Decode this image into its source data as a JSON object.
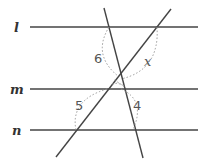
{
  "diagram": {
    "parallel_lines": [
      {
        "name": "l",
        "label": "l",
        "y": 27,
        "x1": 30,
        "x2": 198
      },
      {
        "name": "m",
        "label": "m",
        "y": 89,
        "x1": 30,
        "x2": 198
      },
      {
        "name": "n",
        "label": "n",
        "y": 130,
        "x1": 30,
        "x2": 198
      }
    ],
    "transversals": [
      {
        "name": "steep",
        "x1": 104,
        "y1": 8,
        "x2": 143,
        "y2": 158
      },
      {
        "name": "diagonal",
        "x1": 171,
        "y1": 9,
        "x2": 56,
        "y2": 157
      }
    ],
    "angle_labels": [
      {
        "id": "angle-6",
        "text": "6",
        "x": 94,
        "y": 63
      },
      {
        "id": "angle-x",
        "text": "x",
        "x": 144,
        "y": 63
      },
      {
        "id": "angle-5",
        "text": "5",
        "x": 75,
        "y": 110
      },
      {
        "id": "angle-4",
        "text": "4",
        "x": 133,
        "y": 110
      }
    ],
    "colors": {
      "line": "#444444",
      "arc": "#9a9a9a",
      "text": "#333333"
    }
  }
}
